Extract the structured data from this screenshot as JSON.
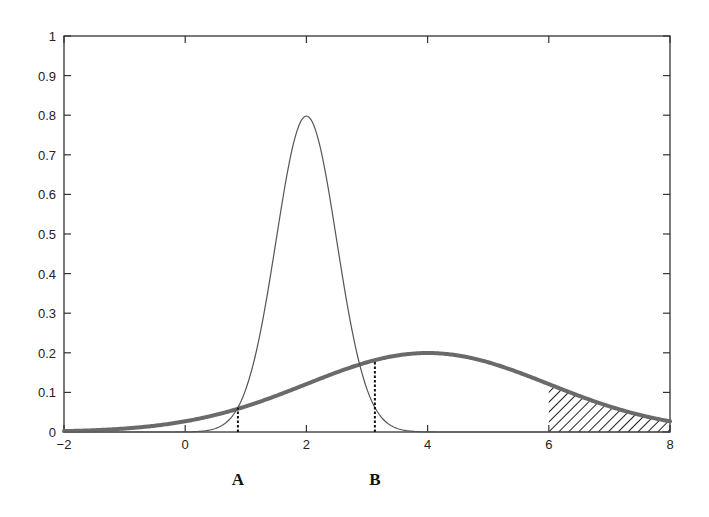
{
  "chart_data": {
    "type": "line",
    "title": "",
    "xlabel": "",
    "ylabel": "",
    "xlim": [
      -2,
      8
    ],
    "ylim": [
      0,
      1
    ],
    "x_ticks": [
      -2,
      0,
      2,
      4,
      6,
      8
    ],
    "y_ticks": [
      0,
      0.1,
      0.2,
      0.3,
      0.4,
      0.5,
      0.6,
      0.7,
      0.8,
      0.9,
      1
    ],
    "x_tick_labels": [
      "-2",
      "0",
      "2",
      "4",
      "6",
      "8"
    ],
    "y_tick_labels": [
      "0",
      "0.1",
      "0.2",
      "0.3",
      "0.4",
      "0.5",
      "0.6",
      "0.7",
      "0.8",
      "0.9",
      "1"
    ],
    "grid": false,
    "legend": null,
    "series": [
      {
        "name": "narrow-gaussian",
        "description": "Normal density, mean 2, sd 0.5 (thin line)",
        "mean": 2,
        "sd": 0.5,
        "peak": 0.8,
        "stroke_width": 1.2,
        "color": "#555555"
      },
      {
        "name": "wide-gaussian",
        "description": "Normal density, mean 4, sd 2 (thick line)",
        "mean": 4,
        "sd": 2,
        "peak": 0.2,
        "stroke_width": 4,
        "color": "#6a6a6a"
      }
    ],
    "annotations": [
      {
        "label": "A",
        "x": 0.87,
        "type": "dotted-vertical-line",
        "y_top": 0.061
      },
      {
        "label": "B",
        "x": 3.13,
        "type": "dotted-vertical-line",
        "y_top": 0.181
      }
    ],
    "shaded_regions": [
      {
        "from_x": 6,
        "to_x": 8,
        "under_series": "wide-gaussian",
        "style": "diagonal-hatch"
      }
    ]
  },
  "labels": {
    "A": "A",
    "B": "B"
  }
}
